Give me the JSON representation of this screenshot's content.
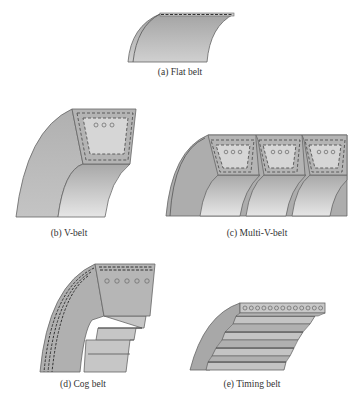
{
  "figure": {
    "panels": [
      {
        "id": "a",
        "caption": "(a) Flat belt"
      },
      {
        "id": "b",
        "caption": "(b) V-belt"
      },
      {
        "id": "c",
        "caption": "(c) Multi-V-belt"
      },
      {
        "id": "d",
        "caption": "(d) Cog belt"
      },
      {
        "id": "e",
        "caption": "(e) Timing belt"
      }
    ],
    "colors": {
      "belt_dark": "#a6a6a6",
      "belt_mid": "#b8b8b8",
      "belt_light": "#d8d8d8",
      "outline": "#555555",
      "dash": "#444444"
    },
    "details": {
      "v_belt_cords": 3,
      "multi_v_ribs": 3,
      "multi_v_cords_per_rib": 3,
      "cog_belt_cords": 5,
      "timing_belt_cords": 13
    }
  }
}
